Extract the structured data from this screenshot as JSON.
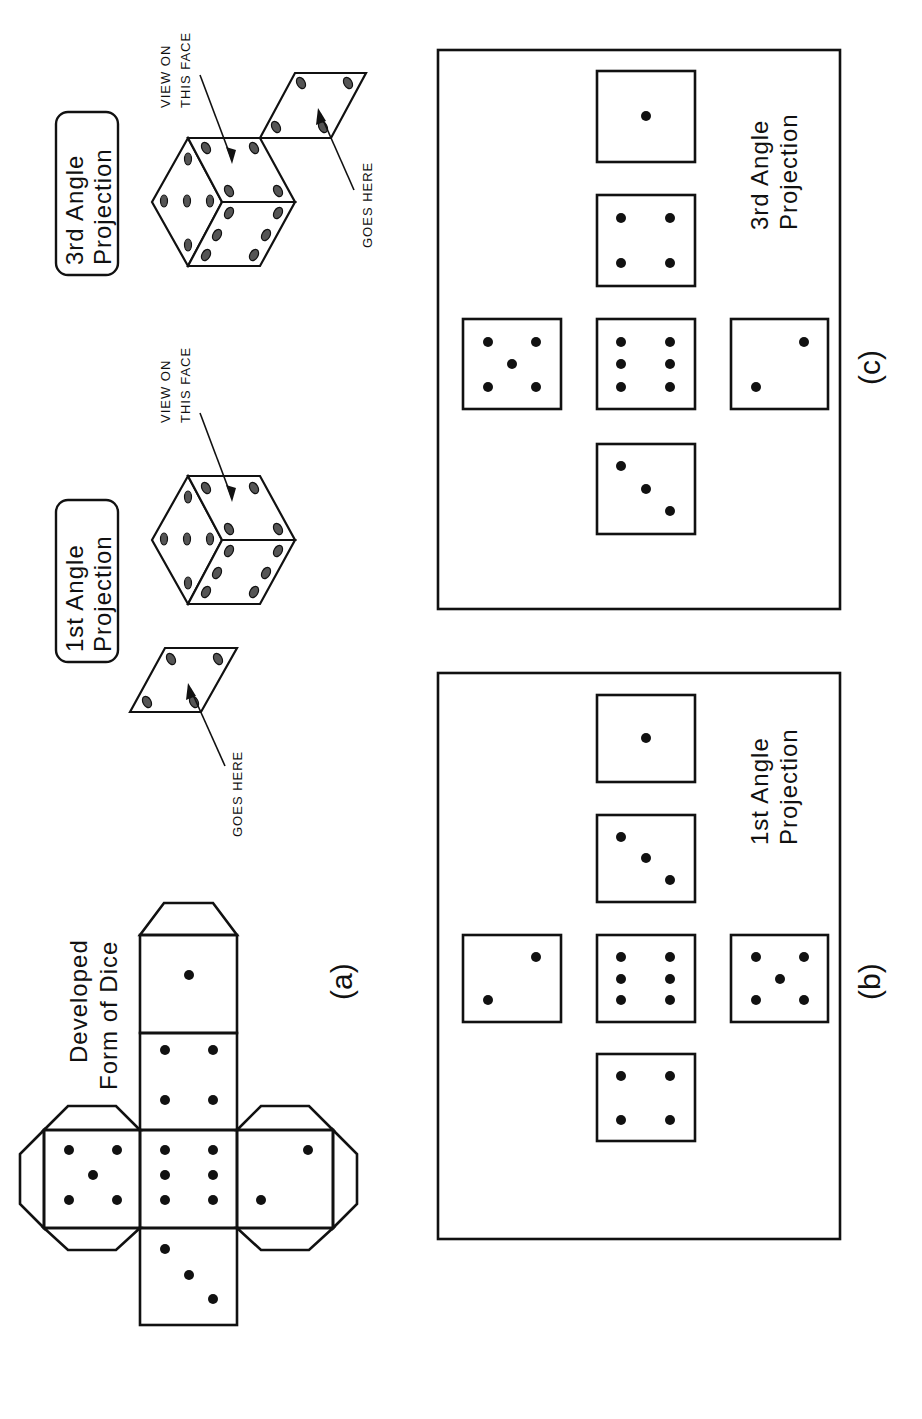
{
  "diagram": {
    "title_net": [
      "Developed",
      "Form of Dice"
    ],
    "label_a": "(a)",
    "label_b": "(b)",
    "label_c": "(c)",
    "first_angle_badge": [
      "1st Angle",
      "Projection"
    ],
    "third_angle_badge": [
      "3rd Angle",
      "Projection"
    ],
    "first_angle_box_title": [
      "1st Angle",
      "Projection"
    ],
    "third_angle_box_title": [
      "3rd Angle",
      "Projection"
    ],
    "view_callout": [
      "VIEW ON",
      "THIS FACE"
    ],
    "goes_here": "GOES HERE",
    "net_faces": [
      {
        "position": "top",
        "pips": 3
      },
      {
        "position": "center",
        "pips": 6
      },
      {
        "position": "upper",
        "pips": 4
      },
      {
        "position": "bottom",
        "pips": 1
      },
      {
        "position": "left",
        "pips": 5
      },
      {
        "position": "right",
        "pips": 2
      }
    ],
    "first_angle_views": [
      {
        "position": "left",
        "pips": 4
      },
      {
        "position": "upper",
        "pips": 2
      },
      {
        "position": "center",
        "pips": 6
      },
      {
        "position": "lower",
        "pips": 5
      },
      {
        "position": "right-1",
        "pips": 3
      },
      {
        "position": "right-2",
        "pips": 1
      }
    ],
    "third_angle_views": [
      {
        "position": "left",
        "pips": 3
      },
      {
        "position": "upper",
        "pips": 5
      },
      {
        "position": "center",
        "pips": 6
      },
      {
        "position": "lower",
        "pips": 2
      },
      {
        "position": "right-1",
        "pips": 4
      },
      {
        "position": "right-2",
        "pips": 1
      }
    ],
    "colors": {
      "ink": "#111111",
      "background": "#ffffff"
    }
  }
}
